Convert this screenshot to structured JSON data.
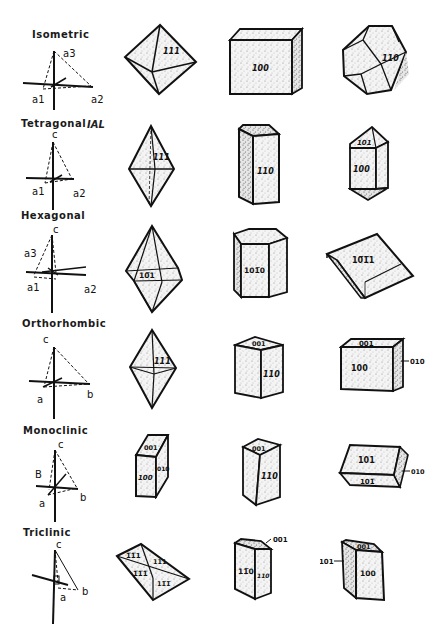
{
  "figure": {
    "systems": [
      {
        "name": "Isometric",
        "axes_labels": [
          "a3",
          "a1",
          "a2"
        ],
        "forms": [
          {
            "shape": "octahedron",
            "faces": [
              "111"
            ]
          },
          {
            "shape": "cube",
            "faces": [
              "100"
            ]
          },
          {
            "shape": "dodecahedron",
            "faces": [
              "110"
            ]
          }
        ]
      },
      {
        "name": "Tetragonal",
        "annotation": "IAL",
        "axes_labels": [
          "c",
          "a1",
          "a2"
        ],
        "forms": [
          {
            "shape": "dipyramid",
            "faces": [
              "111"
            ]
          },
          {
            "shape": "prism",
            "faces": [
              "110"
            ]
          },
          {
            "shape": "prism-with-dipyramid",
            "faces": [
              "101",
              "100"
            ]
          }
        ]
      },
      {
        "name": "Hexagonal",
        "axes_labels": [
          "c",
          "a3",
          "a1",
          "a2"
        ],
        "forms": [
          {
            "shape": "dipyramid",
            "faces": [
              "10̅1"
            ]
          },
          {
            "shape": "hexagonal-prism",
            "faces": [
              "101̅0"
            ]
          },
          {
            "shape": "rhombohedron",
            "faces": [
              "10̅1̅1"
            ]
          }
        ]
      },
      {
        "name": "Orthorhombic",
        "axes_labels": [
          "c",
          "a",
          "b"
        ],
        "forms": [
          {
            "shape": "dipyramid",
            "faces": [
              "111"
            ]
          },
          {
            "shape": "prism",
            "faces": [
              "001",
              "110"
            ]
          },
          {
            "shape": "pinacoids",
            "faces": [
              "001",
              "100",
              "010"
            ]
          }
        ]
      },
      {
        "name": "Monoclinic",
        "axes_labels": [
          "c",
          "B",
          "a",
          "b"
        ],
        "forms": [
          {
            "shape": "pinacoids",
            "faces": [
              "001",
              "100",
              "010"
            ]
          },
          {
            "shape": "prism",
            "faces": [
              "001",
              "110"
            ]
          },
          {
            "shape": "prism",
            "faces": [
              "101",
              "101̅",
              "010"
            ]
          }
        ]
      },
      {
        "name": "Triclinic",
        "axes_labels": [
          "c",
          "a",
          "b"
        ],
        "forms": [
          {
            "shape": "pinacoids",
            "faces": [
              "1̅1̅1",
              "111",
              "1̅1̅1̅",
              "11̅1̅"
            ]
          },
          {
            "shape": "prism",
            "faces": [
              "001",
              "11̅0",
              "110"
            ]
          },
          {
            "shape": "pinacoids",
            "faces": [
              "001",
              "101",
              "100"
            ]
          }
        ]
      }
    ]
  }
}
